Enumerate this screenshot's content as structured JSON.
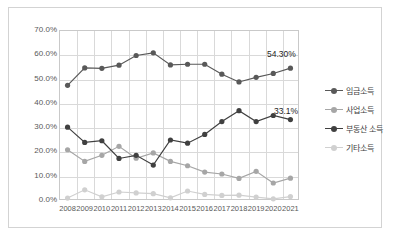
{
  "chart_data": {
    "type": "line",
    "title": "",
    "xlabel": "",
    "ylabel": "",
    "grid": true,
    "legend_position": "right",
    "ylim": [
      0,
      70
    ],
    "ytick_labels": [
      "70.0%",
      "60.0%",
      "50.0%",
      "40.0%",
      "30.0%",
      "20.0%",
      "10.0%",
      "0.0%"
    ],
    "ytick_values": [
      70,
      60,
      50,
      40,
      30,
      20,
      10,
      0
    ],
    "categories": [
      "2008",
      "2009",
      "2010",
      "2011",
      "2012",
      "2013",
      "2014",
      "2015",
      "2016",
      "2017",
      "2018",
      "2019",
      "2020",
      "2021"
    ],
    "series": [
      {
        "name": "임금소득",
        "color": "#595959",
        "values": [
          47.2,
          54.4,
          54.2,
          55.5,
          59.5,
          60.6,
          55.6,
          55.9,
          55.9,
          51.8,
          48.6,
          50.5,
          52.1,
          54.3
        ]
      },
      {
        "name": "사업소득",
        "color": "#a6a6a6",
        "values": [
          20.7,
          15.9,
          18.4,
          22.1,
          17.2,
          19.4,
          15.9,
          14.1,
          11.5,
          10.7,
          8.9,
          11.8,
          7.0,
          9.0
        ]
      },
      {
        "name": "부동산 소득",
        "color": "#404040",
        "values": [
          30.0,
          23.7,
          24.4,
          17.1,
          18.4,
          14.4,
          24.7,
          23.4,
          27.0,
          32.3,
          36.8,
          32.3,
          34.8,
          33.1
        ]
      },
      {
        "name": "기타소득",
        "color": "#d0d0d0",
        "values": [
          0.8,
          4.2,
          1.3,
          3.3,
          2.9,
          2.6,
          0.9,
          3.7,
          2.3,
          1.9,
          2.0,
          1.2,
          0.5,
          1.4
        ]
      }
    ],
    "annotations": [
      {
        "text": "54.30%",
        "series": "임금소득",
        "category": "2021"
      },
      {
        "text": "33.1%",
        "series": "부동산 소득",
        "category": "2021"
      }
    ]
  }
}
